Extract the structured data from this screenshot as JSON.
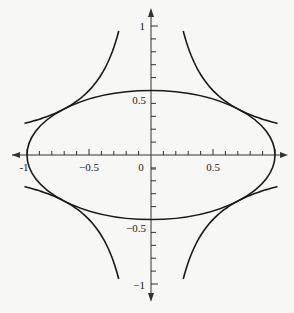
{
  "chart_data": {
    "type": "line",
    "title": "",
    "xlabel": "",
    "ylabel": "",
    "xlim": [
      -1,
      1
    ],
    "ylim": [
      -1,
      1
    ],
    "grid": false,
    "legend": null,
    "x_ticks": {
      "labels": [
        "-1",
        "-0.5",
        "0",
        "0.5"
      ],
      "values": [
        -1,
        -0.5,
        0,
        0.5
      ],
      "minor_step": 0.1
    },
    "y_ticks": {
      "labels": [
        "1",
        "0.5",
        "-0.5",
        "-1"
      ],
      "values": [
        1,
        0.5,
        -0.5,
        -1
      ],
      "minor_step": 0.1
    },
    "series": [
      {
        "name": "ellipse",
        "equation": "x^2 + 4y^2 = 1",
        "semi_axes": [
          1,
          0.5
        ]
      },
      {
        "name": "hyperbola-q1",
        "equation": "xy = 1/4",
        "x_range": [
          0.25,
          1
        ]
      },
      {
        "name": "hyperbola-q2",
        "equation": "xy = -1/4",
        "x_range": [
          -1,
          -0.25
        ]
      },
      {
        "name": "hyperbola-q3",
        "equation": "xy = 1/4",
        "x_range": [
          -1,
          -0.25
        ]
      },
      {
        "name": "hyperbola-q4",
        "equation": "xy = -1/4",
        "x_range": [
          0.25,
          1
        ]
      }
    ],
    "tangent_points": [
      [
        0.707,
        0.354
      ],
      [
        -0.707,
        0.354
      ],
      [
        -0.707,
        -0.354
      ],
      [
        0.707,
        -0.354
      ]
    ]
  },
  "labels": {
    "x_neg1": "-1",
    "x_neg05": "−0.5",
    "x_0": "0",
    "x_05": "0.5",
    "y_1": "1",
    "y_05": "0.5",
    "y_neg05": "−0.5",
    "y_neg1": "−1"
  },
  "colors": {
    "curve": "#1a1a1a",
    "axis": "#333333",
    "background": "#f7f7f5"
  }
}
